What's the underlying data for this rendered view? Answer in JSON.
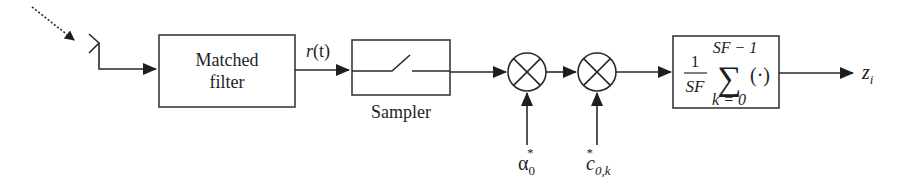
{
  "diagram": {
    "type": "block-diagram",
    "input": {
      "icon": "antenna-icon",
      "signal": "incoming-wave"
    },
    "blocks": [
      {
        "id": "matched_filter",
        "label_line1": "Matched",
        "label_line2": "filter"
      },
      {
        "id": "sampler",
        "label": "Sampler"
      },
      {
        "id": "multiplier_1",
        "symbol": "⊗"
      },
      {
        "id": "multiplier_2",
        "symbol": "⊗"
      },
      {
        "id": "summation",
        "frac_num": "1",
        "frac_den": "SF",
        "sum_symbol": "∑",
        "sum_upper": "SF − 1",
        "sum_lower": "k = 0",
        "operand": "(·)"
      }
    ],
    "signals": {
      "matched_filter_output": {
        "base": "r",
        "arg": "(t)"
      },
      "multiplier_1_input": {
        "base": "α",
        "sub": "0",
        "sup": "*"
      },
      "multiplier_2_input": {
        "base": "c",
        "sub": "0,k",
        "sup": "*"
      },
      "output": {
        "base": "z",
        "sub": "i"
      }
    },
    "colors": {
      "line": "#2a2a2a",
      "text": "#1e1e1e",
      "background": "#ffffff"
    }
  }
}
